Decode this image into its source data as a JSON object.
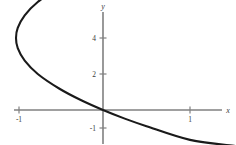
{
  "chart_data": {
    "type": "line",
    "title": "",
    "xlabel": "x",
    "ylabel": "y",
    "grid": false,
    "legend": null,
    "xlim": [
      -1.28,
      1.53
    ],
    "ylim": [
      -1.35,
      4.9
    ],
    "xticks": [
      -1,
      1
    ],
    "xtick_labels": [
      "-1",
      "1"
    ],
    "yticks": [
      -1,
      2,
      4
    ],
    "ytick_labels": [
      "-1",
      "2",
      "4"
    ],
    "curves": [
      {
        "name": "parabola",
        "equation": "x = (y - 2)^2 / 4 - 1",
        "orientation": "opens-right",
        "vertex": [
          -1,
          2
        ],
        "x_intercept": [
          -1,
          2
        ],
        "y_intercepts": [
          0,
          4
        ],
        "color": "#1a1a1a",
        "points": [
          [
            1.52,
            -1.0
          ],
          [
            1.0,
            -0.83
          ],
          [
            0.5,
            -0.45
          ],
          [
            0.25,
            -0.24
          ],
          [
            0.0,
            0.0
          ],
          [
            -0.25,
            0.27
          ],
          [
            -0.5,
            0.59
          ],
          [
            -0.75,
            1.0
          ],
          [
            -0.9,
            1.37
          ],
          [
            -0.98,
            1.72
          ],
          [
            -1.0,
            2.0
          ],
          [
            -0.98,
            2.28
          ],
          [
            -0.9,
            2.63
          ],
          [
            -0.75,
            3.0
          ],
          [
            -0.5,
            3.41
          ],
          [
            -0.25,
            3.73
          ],
          [
            0.0,
            4.0
          ],
          [
            0.25,
            4.24
          ],
          [
            0.5,
            4.45
          ],
          [
            1.0,
            4.83
          ],
          [
            1.52,
            5.15
          ]
        ]
      }
    ]
  },
  "axes": {
    "x_axis_label": "x",
    "y_axis_label": "y",
    "x_tick_labels": [
      "-1",
      "1"
    ],
    "y_tick_labels": [
      "4",
      "2",
      "-1"
    ],
    "axis_color": "#808080",
    "curve_color": "#1a1a1a",
    "background_color": "#ffffff"
  }
}
